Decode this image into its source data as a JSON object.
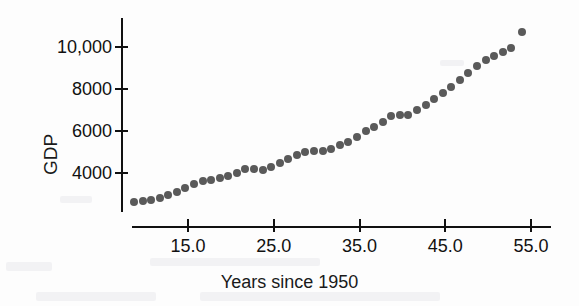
{
  "chart_data": {
    "type": "scatter",
    "title": "",
    "xlabel": "Years since 1950",
    "ylabel": "GDP",
    "xlim": [
      8.0,
      56.0
    ],
    "ylim": [
      2400,
      11200
    ],
    "grid": false,
    "legend": null,
    "point_color": "#5a5a5a",
    "axis_color": "#111111",
    "xticks": [
      "15.0",
      "25.0",
      "35.0",
      "45.0",
      "55.0"
    ],
    "xtick_values": [
      15.0,
      25.0,
      35.0,
      45.0,
      55.0
    ],
    "yticks": [
      "10,000",
      "8000",
      "6000",
      "4000"
    ],
    "ytick_values": [
      10000,
      8000,
      6000,
      4000
    ],
    "x": [
      8.7,
      9.7,
      10.7,
      11.7,
      12.7,
      13.7,
      14.7,
      15.7,
      16.7,
      17.7,
      18.7,
      19.7,
      20.7,
      21.7,
      22.7,
      23.7,
      24.7,
      25.7,
      26.7,
      27.7,
      28.7,
      29.7,
      30.7,
      31.7,
      32.7,
      33.7,
      34.7,
      35.7,
      36.7,
      37.7,
      38.7,
      39.7,
      40.7,
      41.7,
      42.7,
      43.7,
      44.7,
      45.7,
      46.7,
      47.7,
      48.7,
      49.7,
      50.7,
      51.7,
      52.7,
      54.0
    ],
    "y": [
      2600,
      2660,
      2720,
      2810,
      2960,
      3110,
      3280,
      3480,
      3600,
      3690,
      3780,
      3870,
      4000,
      4170,
      4190,
      4160,
      4300,
      4480,
      4680,
      4840,
      5000,
      5060,
      5050,
      5140,
      5320,
      5470,
      5730,
      5990,
      6190,
      6450,
      6700,
      6760,
      6740,
      7000,
      7250,
      7520,
      7800,
      8100,
      8420,
      8760,
      9080,
      9360,
      9560,
      9740,
      9960,
      10700
    ]
  },
  "axes": {
    "ylabel_text": "GDP",
    "xlabel_text": "Years since 1950"
  }
}
